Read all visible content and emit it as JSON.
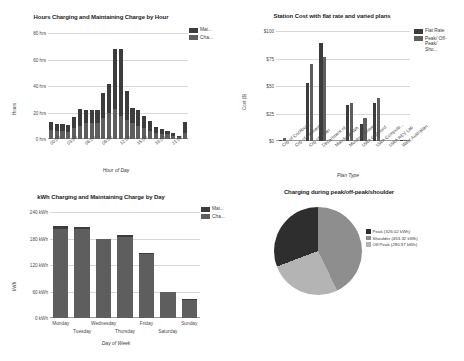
{
  "colors": {
    "series_dark": "#3c3c3c",
    "series_mid": "#5e5e5e",
    "pie_peak": "#2e2e2e",
    "pie_shoulder": "#8e8e8e",
    "pie_offpeak": "#b4b4b4",
    "grid": "#d8d8d8",
    "axis": "#9a9a9a"
  },
  "chart_data": [
    {
      "type": "bar",
      "id": "hours-by-hour",
      "title": "Hours Charging and Maintaining Charge by Hour",
      "xlabel": "Hour of Day",
      "ylabel": "Hours",
      "ylim": [
        0,
        80
      ],
      "yticks": [
        "0 hrs",
        "20 hrs",
        "40 hrs",
        "60 hrs",
        "80 hrs"
      ],
      "ytick_values": [
        0,
        20,
        40,
        60,
        80
      ],
      "grid": true,
      "stacked": true,
      "legend_position": "right",
      "legend": [
        "Mai...",
        "Cha..."
      ],
      "legend_full": [
        "Maintaining Charge",
        "Charging"
      ],
      "categories": [
        "00:00",
        "01:00",
        "02:00",
        "03:00",
        "04:00",
        "05:00",
        "06:00",
        "07:00",
        "08:00",
        "09:00",
        "10:00",
        "11:00",
        "12:00",
        "13:00",
        "14:00",
        "15:00",
        "16:00",
        "17:00",
        "18:00",
        "19:00",
        "20:00",
        "21:00",
        "22:00",
        "23:00"
      ],
      "xticks": [
        "00:00",
        "03:00",
        "06:00",
        "09:00",
        "12:00",
        "15:00",
        "18:00",
        "21:00"
      ],
      "series": [
        {
          "name": "Cha...",
          "values": [
            6.5,
            6.0,
            6.0,
            5.5,
            8.0,
            10.0,
            12.0,
            12.0,
            12.0,
            16.0,
            19.5,
            23.0,
            17.0,
            14.0,
            12.0,
            10.0,
            8.0,
            6.0,
            4.5,
            4.0,
            3.5,
            2.5,
            1.5,
            4.5
          ]
        },
        {
          "name": "Mai...",
          "values": [
            6.0,
            5.5,
            5.5,
            5.0,
            8.5,
            12.5,
            10.0,
            10.0,
            10.0,
            19.0,
            22.0,
            45.0,
            51.0,
            22.5,
            11.5,
            12.0,
            9.0,
            7.5,
            4.5,
            3.5,
            2.5,
            2.0,
            1.0,
            8.5
          ]
        }
      ],
      "totals": [
        12.5,
        11.5,
        11.5,
        10.5,
        16.5,
        22.5,
        22.0,
        22.0,
        22.0,
        35.0,
        41.5,
        68.0,
        68.0,
        36.5,
        23.5,
        22.0,
        17.0,
        13.5,
        9.0,
        7.5,
        6.0,
        4.5,
        2.5,
        13.0
      ]
    },
    {
      "type": "bar",
      "id": "station-cost",
      "title": "Station Cost with flat rate and varied plans",
      "xlabel": "Plan Type",
      "ylabel": "Cost ($)",
      "ylim": [
        0,
        100
      ],
      "yticks": [
        "$0",
        "$25",
        "$50",
        "$75",
        "$100"
      ],
      "ytick_values": [
        0,
        25,
        50,
        75,
        100
      ],
      "grid": true,
      "grouped": true,
      "legend_position": "right",
      "legend": [
        "Flat Rate",
        "Peak/ Off- Peak/ Sho..."
      ],
      "legend_full": [
        "Flat Rate",
        "Peak/Off-Peak/Shoulder"
      ],
      "categories": [
        "City of Cockburn",
        "City of Fremant...",
        "City of Swan",
        "Department of...",
        "Mandurah WA",
        "Murdoch Unive...",
        "UWA Guildford",
        "UWA Compute...",
        "UWA REV Lab",
        "West Australian"
      ],
      "series": [
        {
          "name": "Flat Rate",
          "values": [
            1.0,
            0.0,
            53.0,
            89.0,
            0.0,
            33.0,
            15.5,
            34.5,
            0.0,
            1.0
          ]
        },
        {
          "name": "Peak/ Off- Peak/ Sho...",
          "values": [
            3.0,
            0.0,
            70.0,
            76.0,
            0.0,
            35.0,
            21.0,
            39.5,
            0.0,
            1.2
          ]
        }
      ]
    },
    {
      "type": "bar",
      "id": "kwh-by-day",
      "title": "kWh Charging and Maintaining Charge by Day",
      "xlabel": "Day of Week",
      "ylabel": "kWh",
      "ylim": [
        0,
        240
      ],
      "yticks": [
        "0 kWh",
        "60 kWh",
        "120 kWh",
        "180 kWh",
        "240 kWh"
      ],
      "ytick_values": [
        0,
        60,
        120,
        180,
        240
      ],
      "grid": true,
      "stacked": true,
      "legend_position": "right",
      "legend": [
        "Mai...",
        "Cha..."
      ],
      "legend_full": [
        "Maintaining Charge",
        "Charging"
      ],
      "categories": [
        "Monday",
        "Tuesday",
        "Wednesday",
        "Thursday",
        "Friday",
        "Saturday",
        "Sunday"
      ],
      "series": [
        {
          "name": "Cha...",
          "values": [
            202,
            202,
            178,
            184,
            146,
            59,
            41
          ]
        },
        {
          "name": "Mai...",
          "values": [
            6,
            5,
            2,
            4,
            2,
            1,
            1
          ]
        }
      ],
      "totals": [
        208,
        207,
        180,
        188,
        148,
        60,
        42
      ]
    },
    {
      "type": "pie",
      "id": "peak-offpeak-shoulder",
      "title": "Charging during peak/off-peak/shoulder",
      "legend_position": "right",
      "labels": [
        "Peak (326.02 kWh)",
        "Shoulder (453.32 kWh)",
        "Off Peak (280.97 kWh)"
      ],
      "slice_names": [
        "Peak",
        "Shoulder",
        "Off Peak"
      ],
      "values": [
        326.02,
        453.32,
        280.97
      ],
      "unit": "kWh"
    }
  ]
}
